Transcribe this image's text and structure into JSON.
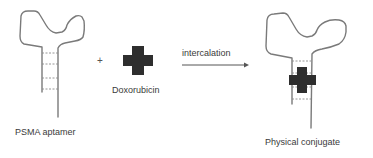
{
  "diagram": {
    "type": "reaction-scheme",
    "left_item": {
      "label": "PSMA aptamer",
      "shape": "hairpin-aptamer"
    },
    "operator": "+",
    "reagent": {
      "label": "Doxorubicin",
      "shape": "cross"
    },
    "arrow": {
      "label": "intercalation",
      "direction": "right"
    },
    "product": {
      "label": "Physical conjugate",
      "shape": "aptamer-with-intercalated-cross"
    },
    "colors": {
      "strand": "#7a7a7a",
      "dashes": "#8a8a8a",
      "drug": "#2e2e2e",
      "text": "#3a3a3a"
    }
  }
}
